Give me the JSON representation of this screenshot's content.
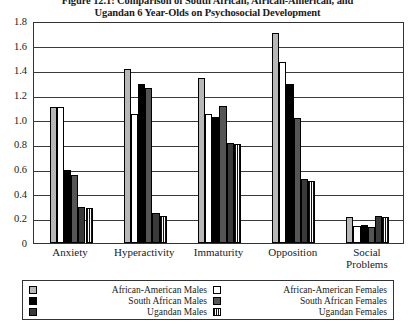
{
  "chart_data": {
    "type": "bar",
    "title": "Figure 12.1: Comparison of South African, African-American, and Ugandan 6 Year-Olds on Psychosocial Development",
    "title_line1": "Figure 12.1: Comparison of South African, African-American, and",
    "title_line2": "Ugandan 6 Year-Olds on Psychosocial Development",
    "xlabel": "",
    "ylabel": "",
    "ylim": [
      0,
      1.8
    ],
    "ytick_labels": [
      "1.8",
      "1.6",
      "1.4",
      "1.2",
      "1.0",
      "0.8",
      "0.6",
      "0.4",
      "0.2",
      "0"
    ],
    "ytick_values": [
      1.8,
      1.6,
      1.4,
      1.2,
      1.0,
      0.8,
      0.6,
      0.4,
      0.2,
      0
    ],
    "grid": true,
    "legend_position": "bottom",
    "categories": [
      "Anxiety",
      "Hyperactivity",
      "Immaturity",
      "Opposition",
      "Social Problems"
    ],
    "category_labels": [
      {
        "line1": "Anxiety",
        "line2": ""
      },
      {
        "line1": "Hyperactivity",
        "line2": ""
      },
      {
        "line1": "Immaturity",
        "line2": ""
      },
      {
        "line1": "Opposition",
        "line2": ""
      },
      {
        "line1": "Social",
        "line2": "Problems"
      }
    ],
    "series": [
      {
        "name": "African-American Males",
        "color": "#b7b7b7",
        "pattern": "solid",
        "values": [
          1.1,
          1.41,
          1.34,
          1.7,
          0.21
        ]
      },
      {
        "name": "African-American Females",
        "color": "#ffffff",
        "pattern": "solid",
        "values": [
          1.1,
          1.05,
          1.05,
          1.47,
          0.14
        ]
      },
      {
        "name": "South African Males",
        "color": "#000000",
        "pattern": "solid",
        "values": [
          0.59,
          1.29,
          1.02,
          1.29,
          0.15
        ]
      },
      {
        "name": "South African Females",
        "color": "#555555",
        "pattern": "solid",
        "values": [
          0.55,
          1.26,
          1.11,
          1.01,
          0.13
        ]
      },
      {
        "name": "Ugandan Males",
        "color": "#3a3a3a",
        "pattern": "solid",
        "values": [
          0.29,
          0.24,
          0.81,
          0.52,
          0.22
        ]
      },
      {
        "name": "Ugandan Females",
        "color": "#3a3a3a",
        "pattern": "vstripes",
        "values": [
          0.28,
          0.22,
          0.8,
          0.5,
          0.21
        ]
      }
    ]
  },
  "legend": {
    "left_column": [
      {
        "label": "African-American Males",
        "swatch": "swatch-african-american-males"
      },
      {
        "label": "South African Males",
        "swatch": "swatch-south-african-males"
      },
      {
        "label": "Ugandan Males",
        "swatch": "swatch-ugandan-males"
      }
    ],
    "right_column": [
      {
        "label": "African-American Females",
        "swatch": "swatch-african-american-females"
      },
      {
        "label": "South African Females",
        "swatch": "swatch-south-african-females"
      },
      {
        "label": "Ugandan Females",
        "swatch": "swatch-ugandan-females"
      }
    ]
  }
}
